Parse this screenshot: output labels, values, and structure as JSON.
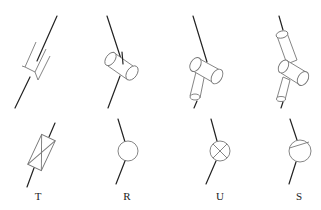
{
  "figure": {
    "joints": [
      {
        "id": "T",
        "label": "T",
        "top_icon": "telescopic-joint-3d-icon",
        "bottom_icon": "prismatic-box-symbol-icon"
      },
      {
        "id": "R",
        "label": "R",
        "top_icon": "revolute-cylinder-3d-icon",
        "bottom_icon": "circle-symbol-icon"
      },
      {
        "id": "U",
        "label": "U",
        "top_icon": "universal-two-cylinder-3d-icon",
        "bottom_icon": "circle-cross-symbol-icon"
      },
      {
        "id": "S",
        "label": "S",
        "top_icon": "spherical-three-cylinder-3d-icon",
        "bottom_icon": "circle-chord-symbol-icon"
      }
    ]
  },
  "colors": {
    "stem": "#222222",
    "outline": "#777777",
    "background": "#ffffff"
  }
}
